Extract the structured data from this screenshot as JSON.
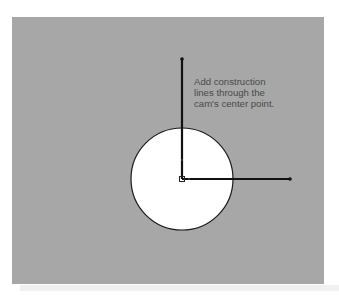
{
  "diagram": {
    "annotation": "Add construction\nlines through the\ncam's center point.",
    "colors": {
      "background": "#a7a7a7",
      "circle_fill": "#ffffff",
      "stroke": "#111111",
      "text": "#4a4a4a"
    },
    "circle": {
      "cx": 182,
      "cy": 179,
      "r": 51
    },
    "construction_lines": [
      {
        "name": "vertical",
        "x1": 182,
        "y1": 179,
        "x2": 182,
        "y2": 59
      },
      {
        "name": "horizontal",
        "x1": 182,
        "y1": 179,
        "x2": 290,
        "y2": 179
      }
    ]
  }
}
